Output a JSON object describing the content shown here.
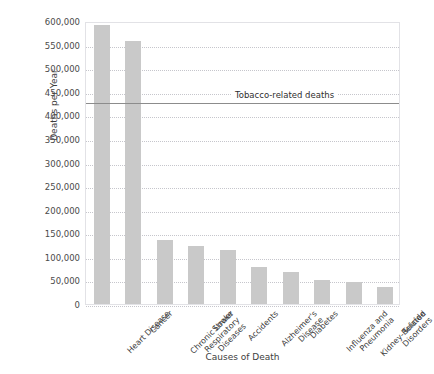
{
  "chart_data": {
    "type": "bar",
    "title": "",
    "xlabel": "Causes of Death",
    "ylabel": "Deaths per Year",
    "ylim": [
      0,
      600000
    ],
    "ytick_step": 50000,
    "ytick_labels": [
      "600,000",
      "550,000",
      "500,000",
      "450,000",
      "400,000",
      "350,000",
      "300,000",
      "250,000",
      "200,000",
      "150,000",
      "100,000",
      "50,000",
      "0"
    ],
    "grid": true,
    "legend_position": "none",
    "bar_color": "#c9c9c9",
    "categories": [
      "Heart Disease",
      "Chronic Lower\nRespiratory\nDiseases",
      "Cancer",
      "Stroke",
      "Accidents",
      "Alzheimer's\nDisease",
      "Diabetes",
      "Influenza and\nPneumonia",
      "Kidney-Related\nDisorders",
      "Suicide"
    ],
    "bars": [
      {
        "label": "Heart Disease",
        "value": 592000
      },
      {
        "label": "Cancer",
        "value": 558000
      },
      {
        "label": "Chronic Lower Respiratory Diseases",
        "value": 135000
      },
      {
        "label": "Stroke",
        "value": 124000
      },
      {
        "label": "Accidents",
        "value": 115000
      },
      {
        "label": "Alzheimer's Disease",
        "value": 78000
      },
      {
        "label": "Diabetes",
        "value": 67000
      },
      {
        "label": "Influenza and Pneumonia",
        "value": 50000
      },
      {
        "label": "Kidney-Related Disorders",
        "value": 47000
      },
      {
        "label": "Suicide",
        "value": 36000
      }
    ],
    "tick_labels_x": [
      "Heart Disease",
      "Cancer",
      "Chronic Lower\nRespiratory\n   Diseases",
      "Stroke",
      "Accidents",
      "Alzheimer's\n  Disease",
      "Diabetes",
      "Influenza and\n Pneumonia",
      "Kidney-Related\n  Disorders",
      "Suicide"
    ],
    "annotations": [
      {
        "name": "tobacco-reference-line",
        "text": "Tobacco-related deaths",
        "value": 430000,
        "color": "#8c8c8c"
      }
    ]
  }
}
